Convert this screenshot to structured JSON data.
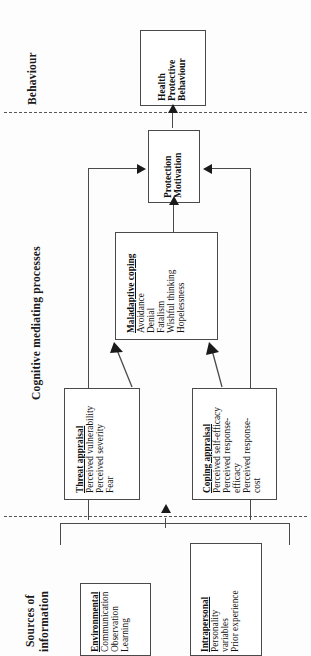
{
  "figure": {
    "orientation": "rotated-90-ccw"
  },
  "sections": [
    {
      "id": "behaviour",
      "label": "Behaviour"
    },
    {
      "id": "cognitive",
      "label": "Cognitive mediating processes"
    },
    {
      "id": "sources_l1",
      "label": "Sources of"
    },
    {
      "id": "sources_l2",
      "label": "information"
    }
  ],
  "boxes": {
    "health_protective_behaviour": {
      "header": "",
      "lines": [
        "Health",
        "Protective",
        "Behaviour"
      ],
      "bold": true
    },
    "protection_motivation": {
      "header": "",
      "lines": [
        "Protection",
        "Motivation"
      ],
      "bold": true
    },
    "maladaptive_coping": {
      "header": "Maladaptive coping",
      "lines": [
        "Avoidance",
        "Denial",
        "Fatalism",
        "Wishful thinking",
        "Hopelessness"
      ]
    },
    "threat_appraisal": {
      "header": "Threat appraisal",
      "lines": [
        "Perceived vulnerability",
        "Perceived severity",
        "Fear"
      ]
    },
    "coping_appraisal": {
      "header": "Coping appraisal",
      "lines": [
        "Perceived self-efficacy",
        "Perceived response-",
        "efficacy",
        "Perceived response-",
        "cost"
      ]
    },
    "environmental": {
      "header": "Environmental",
      "lines": [
        "Communication",
        "Observation",
        "Learning"
      ]
    },
    "intrapersonal": {
      "header": "Intrapersonal",
      "lines": [
        "Personality",
        "variables",
        "Prior experience"
      ]
    }
  },
  "colors": {
    "box_border": "#4a4a4a",
    "arrow": "#1a1a1a",
    "dashed": "#555555",
    "text": "#111111",
    "background": "#fdfdfd"
  }
}
